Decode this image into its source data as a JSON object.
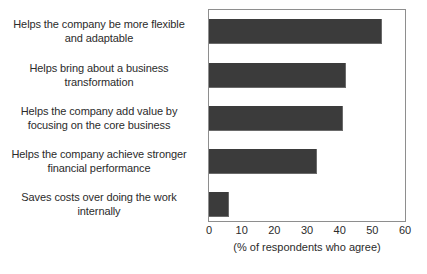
{
  "chart_data": {
    "type": "bar",
    "orientation": "horizontal",
    "title": "",
    "subtitle": "",
    "xlabel": "(% of respondents who agree)",
    "ylabel": "",
    "xlim": [
      0,
      60
    ],
    "xticks": [
      0,
      10,
      20,
      30,
      40,
      50,
      60
    ],
    "xticklabels": [
      "0",
      "10",
      "20",
      "30",
      "40",
      "50",
      "60"
    ],
    "grid": false,
    "legend": null,
    "bar_color": "#3b3b3b",
    "frame_color": "#8e8e8e",
    "categories": [
      "Helps the company be more flexible and adaptable",
      "Helps bring about a business transformation",
      "Helps the company add value by focusing on the core business",
      "Helps the company achieve stronger financial performance",
      "Saves costs over doing the work internally"
    ],
    "category_lines": [
      [
        "Helps the company be more flexible",
        "and adaptable"
      ],
      [
        "Helps bring about a business",
        "transformation"
      ],
      [
        "Helps the company add value by",
        "focusing on the core business"
      ],
      [
        "Helps the company achieve stronger",
        "financial performance"
      ],
      [
        "Saves costs over doing the work",
        "internally"
      ]
    ],
    "values": [
      53,
      42,
      41,
      33,
      6
    ]
  }
}
